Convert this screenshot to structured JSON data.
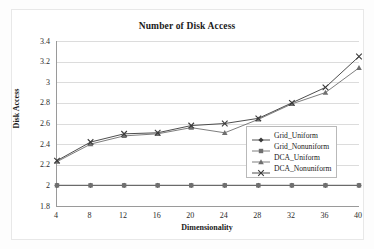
{
  "chart_data": {
    "type": "line",
    "title": "Number of Disk Access",
    "xlabel": "Dimensionality",
    "ylabel": "Disk Access",
    "x": [
      4,
      8,
      12,
      16,
      20,
      24,
      28,
      32,
      36,
      40
    ],
    "xticks": [
      "4",
      "8",
      "12",
      "16",
      "20",
      "24",
      "28",
      "32",
      "36",
      "40"
    ],
    "yticks": [
      "3.4",
      "3.2",
      "3",
      "2.8",
      "2.6",
      "2.4",
      "2.2",
      "2",
      "1.8"
    ],
    "ylim": [
      1.8,
      3.4
    ],
    "xlim": [
      4,
      40
    ],
    "grid": "horizontal",
    "legend_position": "inside-right",
    "series": [
      {
        "name": "Grid_Uniform",
        "marker": "diamond",
        "color": "#3a3a3a",
        "values": [
          2.0,
          2.0,
          2.0,
          2.0,
          2.0,
          2.0,
          2.0,
          2.0,
          2.0,
          2.0
        ]
      },
      {
        "name": "Grid_Nonuniform",
        "marker": "square",
        "color": "#6f6f6f",
        "values": [
          2.0,
          2.0,
          2.0,
          2.0,
          2.0,
          2.0,
          2.0,
          2.0,
          2.0,
          2.0
        ]
      },
      {
        "name": "DCA_Uniform",
        "marker": "triangle",
        "color": "#6f6f6f",
        "values": [
          2.23,
          2.4,
          2.48,
          2.5,
          2.56,
          2.51,
          2.64,
          2.79,
          2.9,
          3.14
        ]
      },
      {
        "name": "DCA_Nonuniform",
        "marker": "cross",
        "color": "#3a3a3a",
        "values": [
          2.24,
          2.42,
          2.5,
          2.51,
          2.58,
          2.6,
          2.65,
          2.8,
          2.95,
          3.25
        ]
      }
    ]
  },
  "legend": {
    "items": [
      {
        "label": "Grid_Uniform"
      },
      {
        "label": "Grid_Nonuniform"
      },
      {
        "label": "DCA_Uniform"
      },
      {
        "label": "DCA_Nonuniform"
      }
    ]
  }
}
